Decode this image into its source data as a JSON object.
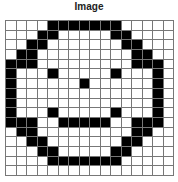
{
  "title": "Image",
  "grid": {
    "rows": 16,
    "cols": 16,
    "on_color": "#000000",
    "off_color": "#ffffff",
    "line_color": "#777777",
    "cells": [
      [
        0,
        0,
        0,
        0,
        1,
        1,
        1,
        1,
        1,
        1,
        1,
        0,
        0,
        0,
        0,
        0
      ],
      [
        0,
        0,
        0,
        1,
        1,
        0,
        0,
        0,
        0,
        0,
        1,
        1,
        0,
        0,
        0,
        0
      ],
      [
        0,
        0,
        1,
        1,
        0,
        0,
        0,
        0,
        0,
        0,
        0,
        1,
        1,
        0,
        0,
        0
      ],
      [
        0,
        1,
        1,
        0,
        0,
        0,
        0,
        0,
        0,
        0,
        0,
        0,
        1,
        1,
        0,
        0
      ],
      [
        1,
        1,
        1,
        0,
        0,
        0,
        0,
        0,
        0,
        0,
        0,
        0,
        1,
        1,
        1,
        0
      ],
      [
        1,
        0,
        0,
        0,
        1,
        0,
        0,
        0,
        0,
        0,
        1,
        0,
        0,
        0,
        1,
        0
      ],
      [
        1,
        0,
        0,
        0,
        0,
        0,
        0,
        1,
        0,
        0,
        0,
        0,
        0,
        0,
        1,
        0
      ],
      [
        1,
        0,
        0,
        0,
        0,
        0,
        0,
        0,
        0,
        0,
        0,
        0,
        0,
        0,
        1,
        0
      ],
      [
        1,
        0,
        0,
        0,
        0,
        0,
        0,
        0,
        0,
        0,
        0,
        0,
        0,
        0,
        1,
        0
      ],
      [
        1,
        0,
        0,
        0,
        1,
        0,
        0,
        0,
        0,
        0,
        1,
        0,
        0,
        0,
        1,
        0
      ],
      [
        1,
        1,
        1,
        0,
        0,
        1,
        1,
        1,
        1,
        1,
        0,
        0,
        1,
        1,
        1,
        0
      ],
      [
        0,
        1,
        1,
        0,
        0,
        0,
        0,
        0,
        0,
        0,
        0,
        0,
        1,
        1,
        0,
        0
      ],
      [
        0,
        0,
        1,
        1,
        0,
        0,
        0,
        0,
        0,
        0,
        0,
        1,
        1,
        0,
        0,
        0
      ],
      [
        0,
        0,
        0,
        1,
        1,
        0,
        0,
        0,
        0,
        0,
        1,
        1,
        0,
        0,
        0,
        0
      ],
      [
        0,
        0,
        0,
        0,
        1,
        1,
        1,
        1,
        1,
        1,
        1,
        0,
        0,
        0,
        0,
        0
      ],
      [
        0,
        0,
        0,
        0,
        0,
        0,
        0,
        0,
        0,
        0,
        0,
        0,
        0,
        0,
        0,
        0
      ]
    ]
  }
}
